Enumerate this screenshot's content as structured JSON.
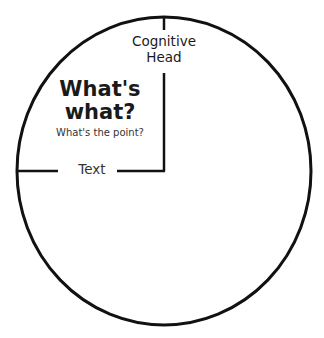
{
  "diagram": {
    "circle_label_top": "Cognitive Head",
    "head_label_line1": "Cognitive",
    "head_label_line2": "Head",
    "title_line1": "What's",
    "title_line2": "what?",
    "subtitle": "What's the point?",
    "text_label": "Text",
    "stroke_color": "#111111",
    "background": "#ffffff"
  }
}
